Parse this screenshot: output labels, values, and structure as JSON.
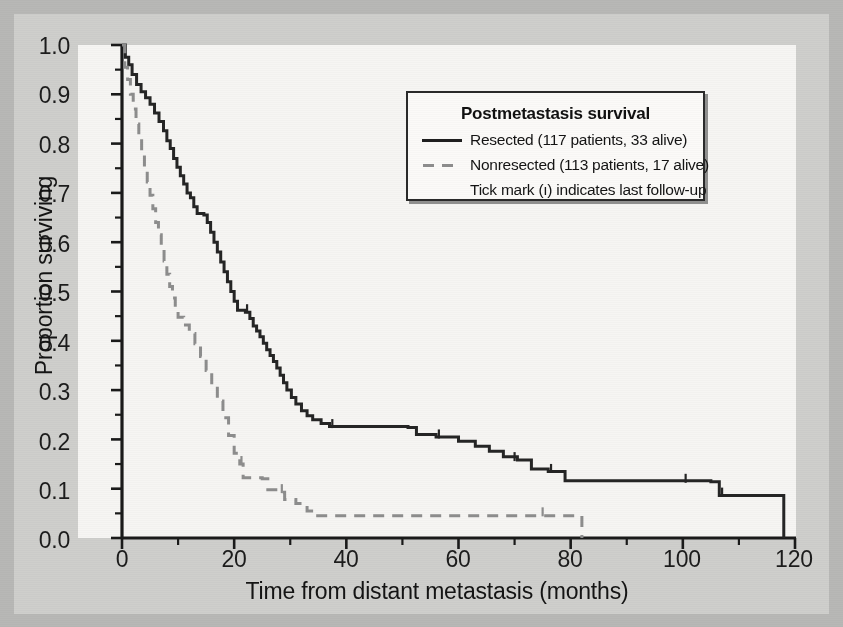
{
  "figure": {
    "background_color": "#b8b8b6",
    "panel_color": "#cfcfcc",
    "plot_background": "#f6f5f3"
  },
  "legend": {
    "title": "Postmetastasis survival",
    "entries": [
      {
        "style": "solid",
        "label": "Resected (117 patients, 33 alive)"
      },
      {
        "style": "dashed",
        "label": "Nonresected (113 patients, 17 alive)"
      }
    ],
    "note": "Tick mark (ı) indicates last follow-up"
  },
  "axes": {
    "x_title": "Time from distant metastasis (months)",
    "y_title": "Proportion surviving",
    "x_ticks": [
      "0",
      "20",
      "40",
      "60",
      "80",
      "100",
      "120"
    ],
    "y_ticks": [
      "0.0",
      "0.1",
      "0.2",
      "0.3",
      "0.4",
      "0.5",
      "0.6",
      "0.7",
      "0.8",
      "0.9",
      "1.0"
    ]
  },
  "chart_data": {
    "type": "line",
    "title": "Postmetastasis survival",
    "xlabel": "Time from distant metastasis (months)",
    "ylabel": "Proportion surviving",
    "xlim": [
      0,
      120
    ],
    "ylim": [
      0.0,
      1.0
    ],
    "xticks": [
      0,
      20,
      40,
      60,
      80,
      100,
      120
    ],
    "xminor_step": 10,
    "yticks": [
      0.0,
      0.1,
      0.2,
      0.3,
      0.4,
      0.5,
      0.6,
      0.7,
      0.8,
      0.9,
      1.0
    ],
    "grid": false,
    "legend_position": "upper-right-inset",
    "curve_style": "step-post (Kaplan-Meier)",
    "colors": {
      "resected": "#252525",
      "nonresected": "#8d8d8d",
      "axis": "#1a1a1a"
    },
    "annotations": [
      "Tick mark (ı) indicates last follow-up"
    ],
    "series": [
      {
        "name": "Resected (117 patients, 33 alive)",
        "n_patients": 117,
        "n_alive": 33,
        "style": "solid",
        "color": "#252525",
        "points": [
          [
            0.0,
            1.0
          ],
          [
            0.6,
            0.975
          ],
          [
            1.2,
            0.96
          ],
          [
            1.8,
            0.94
          ],
          [
            2.6,
            0.92
          ],
          [
            3.4,
            0.905
          ],
          [
            4.2,
            0.893
          ],
          [
            5.0,
            0.88
          ],
          [
            5.8,
            0.862
          ],
          [
            6.6,
            0.845
          ],
          [
            7.4,
            0.826
          ],
          [
            8.0,
            0.806
          ],
          [
            8.6,
            0.79
          ],
          [
            9.2,
            0.77
          ],
          [
            9.8,
            0.752
          ],
          [
            10.4,
            0.735
          ],
          [
            11.0,
            0.718
          ],
          [
            11.6,
            0.7
          ],
          [
            12.2,
            0.69
          ],
          [
            12.8,
            0.672
          ],
          [
            13.4,
            0.658
          ],
          [
            14.6,
            0.655
          ],
          [
            15.2,
            0.64
          ],
          [
            15.8,
            0.62
          ],
          [
            16.4,
            0.6
          ],
          [
            17.0,
            0.58
          ],
          [
            17.6,
            0.56
          ],
          [
            18.2,
            0.54
          ],
          [
            18.8,
            0.52
          ],
          [
            19.4,
            0.5
          ],
          [
            20.0,
            0.48
          ],
          [
            20.6,
            0.462
          ],
          [
            22.0,
            0.458
          ],
          [
            22.8,
            0.445
          ],
          [
            23.4,
            0.43
          ],
          [
            24.0,
            0.42
          ],
          [
            24.6,
            0.408
          ],
          [
            25.2,
            0.395
          ],
          [
            25.8,
            0.382
          ],
          [
            26.4,
            0.37
          ],
          [
            27.0,
            0.358
          ],
          [
            27.6,
            0.345
          ],
          [
            28.2,
            0.33
          ],
          [
            28.8,
            0.315
          ],
          [
            29.4,
            0.3
          ],
          [
            30.2,
            0.285
          ],
          [
            31.0,
            0.272
          ],
          [
            32.0,
            0.258
          ],
          [
            33.0,
            0.248
          ],
          [
            34.0,
            0.24
          ],
          [
            35.5,
            0.232
          ],
          [
            37.0,
            0.226
          ],
          [
            51.0,
            0.224
          ],
          [
            52.5,
            0.21
          ],
          [
            56.0,
            0.205
          ],
          [
            60.0,
            0.196
          ],
          [
            63.0,
            0.186
          ],
          [
            65.5,
            0.176
          ],
          [
            68.0,
            0.165
          ],
          [
            70.5,
            0.158
          ],
          [
            73.0,
            0.14
          ],
          [
            76.0,
            0.135
          ],
          [
            79.0,
            0.116
          ],
          [
            105.0,
            0.114
          ],
          [
            106.5,
            0.086
          ],
          [
            118.0,
            0.085
          ],
          [
            118.0,
            0.0
          ]
        ],
        "censor_marks": [
          [
            22.3,
            0.458
          ],
          [
            37.5,
            0.225
          ],
          [
            56.5,
            0.204
          ],
          [
            70.0,
            0.158
          ],
          [
            76.5,
            0.134
          ],
          [
            100.5,
            0.114
          ],
          [
            107.0,
            0.086
          ]
        ]
      },
      {
        "name": "Nonresected (113 patients, 17 alive)",
        "n_patients": 113,
        "n_alive": 17,
        "style": "dashed",
        "color": "#8d8d8d",
        "points": [
          [
            0.0,
            1.0
          ],
          [
            0.5,
            0.955
          ],
          [
            1.0,
            0.93
          ],
          [
            1.5,
            0.9
          ],
          [
            2.0,
            0.87
          ],
          [
            2.5,
            0.84
          ],
          [
            3.0,
            0.81
          ],
          [
            3.5,
            0.78
          ],
          [
            4.0,
            0.75
          ],
          [
            4.5,
            0.722
          ],
          [
            5.0,
            0.695
          ],
          [
            5.5,
            0.668
          ],
          [
            6.0,
            0.64
          ],
          [
            6.5,
            0.615
          ],
          [
            7.0,
            0.59
          ],
          [
            7.5,
            0.562
          ],
          [
            8.0,
            0.535
          ],
          [
            8.5,
            0.51
          ],
          [
            9.0,
            0.487
          ],
          [
            9.5,
            0.466
          ],
          [
            10.0,
            0.448
          ],
          [
            11.0,
            0.432
          ],
          [
            12.0,
            0.415
          ],
          [
            13.0,
            0.394
          ],
          [
            14.0,
            0.368
          ],
          [
            15.0,
            0.34
          ],
          [
            16.0,
            0.31
          ],
          [
            17.0,
            0.278
          ],
          [
            18.0,
            0.244
          ],
          [
            19.0,
            0.208
          ],
          [
            20.0,
            0.172
          ],
          [
            21.0,
            0.15
          ],
          [
            21.6,
            0.122
          ],
          [
            25.0,
            0.12
          ],
          [
            26.0,
            0.098
          ],
          [
            28.0,
            0.093
          ],
          [
            29.0,
            0.078
          ],
          [
            31.0,
            0.07
          ],
          [
            33.0,
            0.055
          ],
          [
            34.5,
            0.045
          ],
          [
            82.0,
            0.045
          ],
          [
            82.0,
            0.0
          ]
        ],
        "censor_marks": [
          [
            21.3,
            0.15
          ],
          [
            28.5,
            0.093
          ],
          [
            75.0,
            0.046
          ]
        ]
      }
    ]
  }
}
